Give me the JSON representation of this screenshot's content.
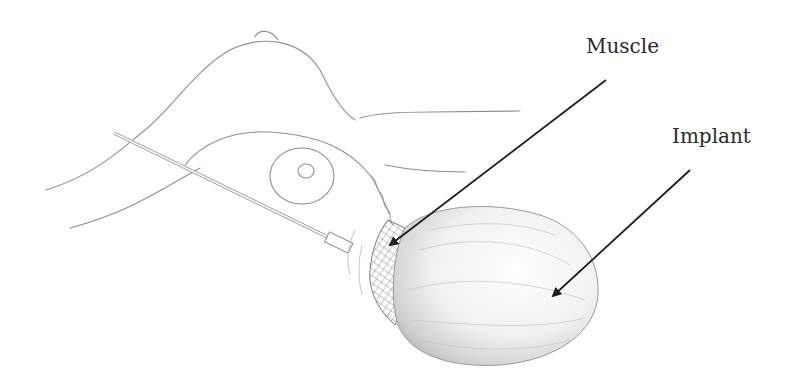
{
  "figure": {
    "type": "medical illustration",
    "labels": {
      "muscle": "Muscle",
      "implant": "Implant"
    },
    "colors": {
      "background": "#ffffff",
      "sketch_line": "#8a8a8a",
      "arrow": "#1e1e1e",
      "label_text": "#2a2a2a",
      "shading": "#bcbcbc"
    }
  }
}
